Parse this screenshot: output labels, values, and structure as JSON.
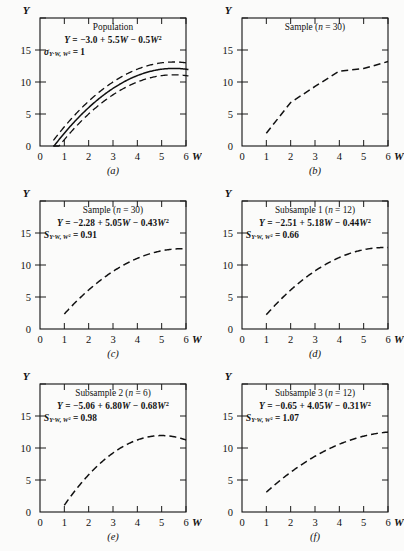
{
  "figure": {
    "background": "#fbfbfa",
    "ink": "#111111",
    "axis": {
      "xlabel": "W",
      "ylabel": "Y",
      "xticks": [
        0,
        1,
        2,
        3,
        4,
        5,
        6
      ],
      "xticklabels": [
        "0",
        "1",
        "2",
        "3",
        "4",
        "5",
        "6"
      ],
      "yticks": [
        0,
        5,
        10,
        15,
        20
      ],
      "yticklabels": [
        "0",
        "5",
        "10",
        "15",
        ""
      ],
      "xlim": [
        0,
        6.6
      ],
      "ylim": [
        0,
        20
      ]
    }
  },
  "chart_data": [
    {
      "type": "line",
      "panel": "a",
      "panel_label": "(a)",
      "title": "Population",
      "equation": "Y = −3.0 + 5.5W − 0.5W²",
      "eq_parts": {
        "intercept": -3.0,
        "b1": 5.5,
        "b2": -0.5
      },
      "dispersion_symbol": "σ",
      "dispersion_sub": "Y·W, W²",
      "dispersion_value": "1",
      "dispersion_num": 1,
      "style": "solid-with-bands",
      "band_offset": 1,
      "xstart": 0.55,
      "xend": 6.1,
      "xlabel": "W",
      "ylabel": "Y"
    },
    {
      "type": "line",
      "panel": "b",
      "panel_label": "(b)",
      "title": "Sample (n = 30)",
      "equation": "",
      "style": "polyline-dashed",
      "x": [
        1,
        2,
        3,
        4,
        5,
        6
      ],
      "values": [
        2.0,
        6.8,
        9.3,
        11.7,
        12.1,
        13.2
      ],
      "xlabel": "W",
      "ylabel": "Y"
    },
    {
      "type": "line",
      "panel": "c",
      "panel_label": "(c)",
      "title": "Sample (n = 30)",
      "equation": "Y = −2.28 + 5.05W − 0.43W²",
      "eq_parts": {
        "intercept": -2.28,
        "b1": 5.05,
        "b2": -0.43
      },
      "dispersion_symbol": "S",
      "dispersion_sub": "Y·W, W²",
      "dispersion_value": "0.91",
      "dispersion_num": 0.91,
      "style": "dashed",
      "xstart": 1.0,
      "xend": 6.0,
      "xlabel": "W",
      "ylabel": "Y"
    },
    {
      "type": "line",
      "panel": "d",
      "panel_label": "(d)",
      "title": "Subsample 1 (n = 12)",
      "equation": "Y = −2.51 + 5.18W − 0.44W²",
      "eq_parts": {
        "intercept": -2.51,
        "b1": 5.18,
        "b2": -0.44
      },
      "dispersion_symbol": "S",
      "dispersion_sub": "Y·W, W²",
      "dispersion_value": "0.66",
      "dispersion_num": 0.66,
      "style": "dashed",
      "xstart": 1.0,
      "xend": 6.0,
      "xlabel": "W",
      "ylabel": "Y"
    },
    {
      "type": "line",
      "panel": "e",
      "panel_label": "(e)",
      "title": "Subsample 2 (n = 6)",
      "equation": "Y = −5.06 + 6.80W − 0.68W²",
      "eq_parts": {
        "intercept": -5.06,
        "b1": 6.8,
        "b2": -0.68
      },
      "dispersion_symbol": "S",
      "dispersion_sub": "Y·W, W²",
      "dispersion_value": "0.98",
      "dispersion_num": 0.98,
      "style": "dashed",
      "xstart": 1.0,
      "xend": 6.0,
      "xlabel": "W",
      "ylabel": "Y"
    },
    {
      "type": "line",
      "panel": "f",
      "panel_label": "(f)",
      "title": "Subsample 3 (n = 12)",
      "equation": "Y = −0.65 + 4.05W − 0.31W²",
      "eq_parts": {
        "intercept": -0.65,
        "b1": 4.05,
        "b2": -0.31
      },
      "dispersion_symbol": "S",
      "dispersion_sub": "Y·W, W²",
      "dispersion_value": "1.07",
      "dispersion_num": 1.07,
      "style": "dashed",
      "xstart": 1.0,
      "xend": 6.0,
      "xlabel": "W",
      "ylabel": "Y"
    }
  ]
}
